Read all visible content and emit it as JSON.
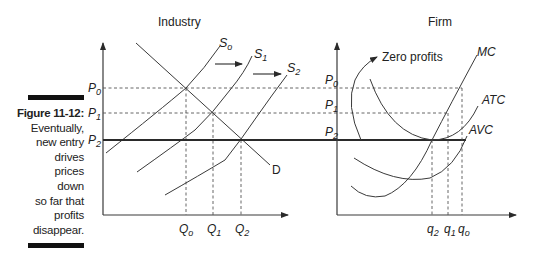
{
  "figure": {
    "number_label": "Figure 11-12:",
    "caption_lines": [
      "Eventually,",
      "new entry",
      "drives",
      "prices down",
      "so far that",
      "profits",
      "disappear."
    ]
  },
  "industry_panel": {
    "title": "Industry",
    "price_labels": {
      "p0": "P",
      "p0_sub": "0",
      "p1": "P",
      "p1_sub": "1",
      "p2": "P",
      "p2_sub": "2"
    },
    "quantity_labels": {
      "q0": "Q",
      "q0_sub": "o",
      "q1": "Q",
      "q1_sub": "1",
      "q2": "Q",
      "q2_sub": "2"
    },
    "curve_labels": {
      "s0": "S",
      "s0_sub": "o",
      "s1": "S",
      "s1_sub": "1",
      "s2": "S",
      "s2_sub": "2",
      "d": "D"
    }
  },
  "firm_panel": {
    "title": "Firm",
    "annotation": "Zero profits",
    "price_labels": {
      "p0": "P",
      "p0_sub": "0",
      "p1": "P",
      "p1_sub": "1",
      "p2": "P",
      "p2_sub": "2"
    },
    "quantity_labels": {
      "q2": "q",
      "q2_sub": "2",
      "q1": "q",
      "q1_sub": "1",
      "q0": "q",
      "q0_sub": "o"
    },
    "curve_labels": {
      "mc": "MC",
      "atc": "ATC",
      "avc": "AVC"
    }
  },
  "colors": {
    "line": "#3a3a3a",
    "heavy_line": "#2a2a2a",
    "dashed": "#555555",
    "caption_bar": "#111111"
  }
}
